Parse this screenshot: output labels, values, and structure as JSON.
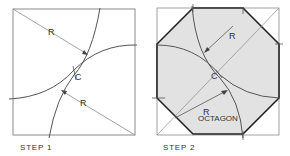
{
  "step1": {
    "caption": "STEP 1",
    "radius_label_top": "R",
    "radius_label_bottom": "R",
    "center_label": "C"
  },
  "step2": {
    "caption": "STEP 2",
    "radius_label_top": "R",
    "radius_label_bottom": "R",
    "center_label": "C",
    "shape_label": "OCTAGON"
  },
  "colors": {
    "line": "#555555",
    "thin_line": "#8a8a8a",
    "octagon_fill": "#e2e2e2",
    "octagon_stroke": "#222222"
  }
}
